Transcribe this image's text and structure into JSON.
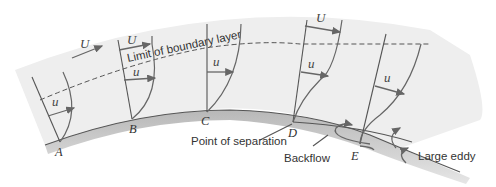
{
  "diagram": {
    "labels": {
      "boundary_limit": "Limit of boundary layer",
      "separation": "Point of separation",
      "backflow": "Backflow",
      "eddy": "Large eddy"
    },
    "variables": {
      "free_stream": "U",
      "local": "u"
    },
    "points": [
      "A",
      "B",
      "C",
      "D",
      "E"
    ],
    "colors": {
      "field": "#ededed",
      "wall_shadow": "#c8c8c8",
      "line": "#555555",
      "text": "#333333"
    }
  }
}
